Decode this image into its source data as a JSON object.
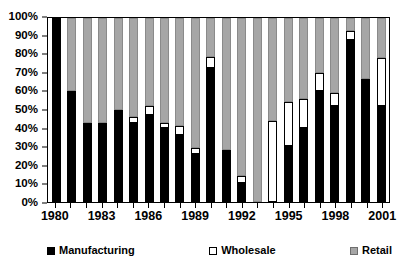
{
  "chart_data": {
    "type": "bar",
    "subtype": "100% stacked column",
    "title": "",
    "xlabel": "",
    "ylabel": "",
    "ylim": [
      0,
      100
    ],
    "ytick_labels": [
      "0%",
      "10%",
      "20%",
      "30%",
      "40%",
      "50%",
      "60%",
      "70%",
      "80%",
      "90%",
      "100%"
    ],
    "ytick_values": [
      0,
      10,
      20,
      30,
      40,
      50,
      60,
      70,
      80,
      90,
      100
    ],
    "xtick_labels": [
      "1980",
      "1983",
      "1986",
      "1989",
      "1992",
      "1995",
      "1998",
      "2001"
    ],
    "grid": false,
    "legend_position": "bottom",
    "categories": [
      "1980",
      "1981",
      "1982",
      "1983",
      "1984",
      "1985",
      "1986",
      "1987",
      "1988",
      "1989",
      "1990",
      "1991",
      "1992",
      "1993",
      "1994",
      "1995",
      "1996",
      "1997",
      "1998",
      "1999",
      "2000",
      "2001"
    ],
    "series": [
      {
        "name": "Manufacturing",
        "color": "#000000",
        "values": [
          100,
          60,
          43,
          43,
          50,
          43,
          47,
          40,
          36,
          26,
          73,
          28,
          10,
          0,
          0,
          30,
          40,
          60,
          52,
          88,
          67,
          52
        ]
      },
      {
        "name": "Wholesale",
        "color": "#ffffff",
        "values": [
          0,
          0,
          0,
          0,
          0,
          3,
          5,
          3,
          5,
          3,
          6,
          0,
          4,
          0,
          44,
          24,
          16,
          10,
          7,
          5,
          0,
          26
        ]
      },
      {
        "name": "Retail",
        "color": "#a6a6a6",
        "values": [
          0,
          40,
          57,
          57,
          50,
          54,
          48,
          57,
          59,
          71,
          21,
          72,
          86,
          100,
          56,
          46,
          44,
          30,
          41,
          7,
          33,
          22
        ]
      }
    ]
  },
  "legend": {
    "items": [
      {
        "label": "Manufacturing",
        "swatch": "manufacturing-swatch"
      },
      {
        "label": "Wholesale",
        "swatch": "wholesale-swatch"
      },
      {
        "label": "Retail",
        "swatch": "retail-swatch"
      }
    ]
  }
}
